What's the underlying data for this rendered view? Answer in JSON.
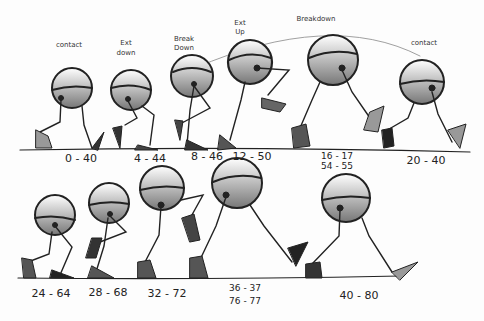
{
  "top_row": {
    "pose_labels": [
      {
        "text": "contact",
        "x": 69,
        "y": 44
      },
      {
        "text": "Ext",
        "x": 126,
        "y": 42
      },
      {
        "text": "down",
        "x": 126,
        "y": 52
      },
      {
        "text": "Break",
        "x": 184,
        "y": 38
      },
      {
        "text": "Down",
        "x": 184,
        "y": 47
      },
      {
        "text": "Ext",
        "x": 240,
        "y": 22
      },
      {
        "text": "Up",
        "x": 240,
        "y": 31
      },
      {
        "text": "Breakdown",
        "x": 316,
        "y": 18
      },
      {
        "text": "contact",
        "x": 424,
        "y": 42
      }
    ],
    "frame_labels": [
      {
        "text": "0 - 40",
        "x": 81,
        "y": 152
      },
      {
        "text": "4 - 44",
        "x": 150,
        "y": 152
      },
      {
        "text": "8 - 46",
        "x": 207,
        "y": 150
      },
      {
        "text": "12 - 50",
        "x": 250,
        "y": 150
      },
      {
        "text": "16 - 17",
        "x": 337,
        "y": 151
      },
      {
        "text": "54 - 55",
        "x": 337,
        "y": 161
      },
      {
        "text": "20 - 40",
        "x": 426,
        "y": 153
      }
    ]
  },
  "bottom_row": {
    "frame_labels": [
      {
        "text": "24 - 64",
        "x": 51,
        "y": 289
      },
      {
        "text": "28 - 68",
        "x": 108,
        "y": 289
      },
      {
        "text": "32 - 72",
        "x": 167,
        "y": 289
      },
      {
        "text": "36 - 37",
        "x": 245,
        "y": 285
      },
      {
        "text": "76 - 77",
        "x": 245,
        "y": 297
      },
      {
        "text": "40 - 80",
        "x": 359,
        "y": 290
      }
    ]
  }
}
